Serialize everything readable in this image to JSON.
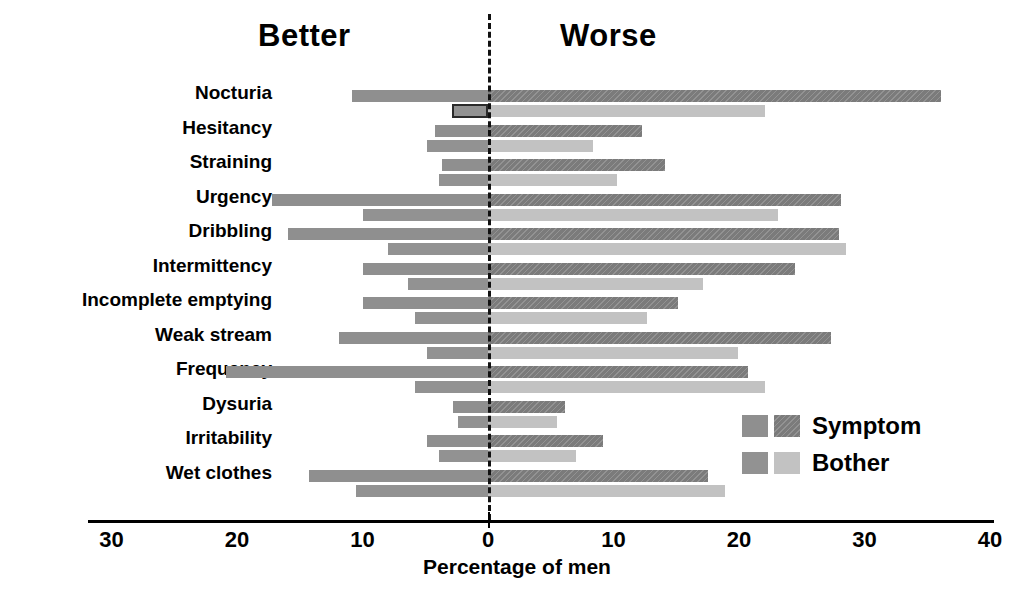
{
  "headers": {
    "better": "Better",
    "worse": "Worse"
  },
  "axis": {
    "title": "Percentage of men",
    "ticks": [
      "30",
      "20",
      "10",
      "0",
      "10",
      "20",
      "30",
      "40"
    ]
  },
  "legend": {
    "items": [
      {
        "label": "Symptom"
      },
      {
        "label": "Bother"
      }
    ]
  },
  "chart_data": {
    "type": "bar",
    "title": "",
    "subtitle": "",
    "xlabel": "Percentage of men",
    "ylabel": "",
    "orientation": "horizontal",
    "style": "diverging-bidirectional",
    "axis_left_header": "Better",
    "axis_right_header": "Worse",
    "xlim": [
      -30,
      40
    ],
    "xticks": [
      -30,
      -20,
      -10,
      0,
      10,
      20,
      30,
      40
    ],
    "xtick_labels": [
      "30",
      "20",
      "10",
      "0",
      "10",
      "20",
      "30",
      "40"
    ],
    "grid": false,
    "legend_position": "inside-right",
    "categories": [
      "Nocturia",
      "Hesitancy",
      "Straining",
      "Urgency",
      "Dribbling",
      "Intermittency",
      "Incomplete emptying",
      "Weak stream",
      "Frequency",
      "Dysuria",
      "Irritability",
      "Wet clothes"
    ],
    "series": [
      {
        "name": "Symptom",
        "better": [
          10.8,
          4.2,
          3.7,
          17.2,
          15.9,
          10.0,
          10.0,
          11.9,
          20.9,
          2.8,
          4.9,
          14.3
        ],
        "worse": [
          36.1,
          12.3,
          14.1,
          28.1,
          28.0,
          24.5,
          15.1,
          27.3,
          20.7,
          6.1,
          9.2,
          17.5
        ]
      },
      {
        "name": "Bother",
        "better": [
          2.9,
          4.9,
          3.9,
          10.0,
          8.0,
          6.4,
          5.8,
          4.9,
          5.8,
          2.4,
          3.9,
          10.5
        ],
        "worse": [
          22.1,
          8.4,
          10.3,
          23.1,
          28.5,
          17.1,
          12.7,
          19.9,
          22.1,
          5.5,
          7.0,
          18.9
        ]
      }
    ],
    "annotations": [
      {
        "type": "highlight-box",
        "category": "Nocturia",
        "series": "Bother",
        "range": [
          -2.9,
          0
        ]
      }
    ]
  }
}
